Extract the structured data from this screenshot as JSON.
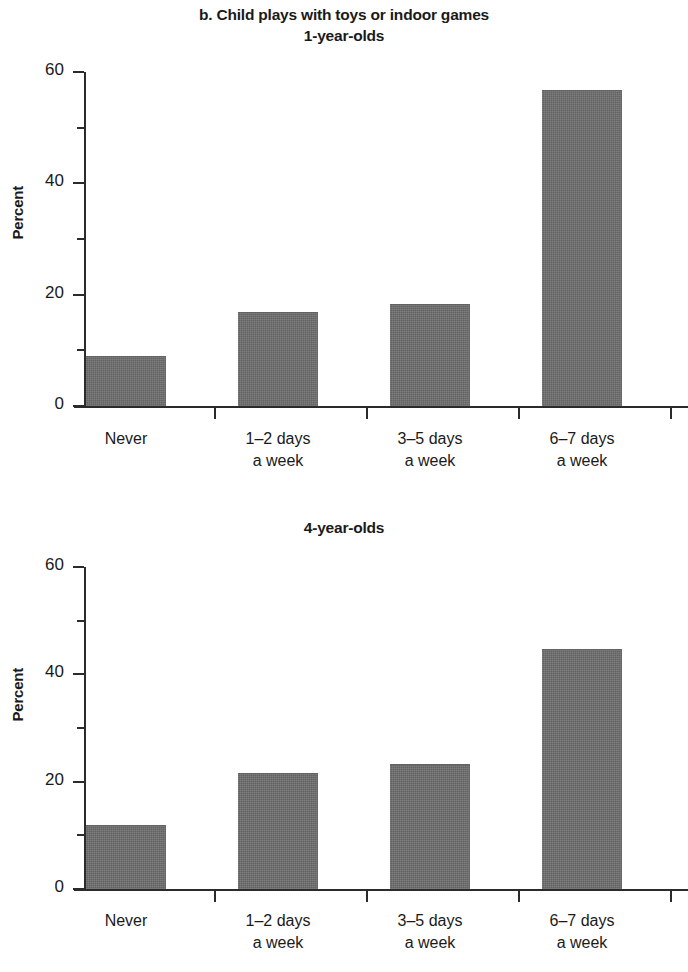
{
  "figure": {
    "title": "b. Child plays with toys or indoor games",
    "subtitle": "1-year-olds",
    "panel2_title": "4-year-olds",
    "bar_color": "#6e6e6e",
    "axis_color": "#2b2b2b"
  },
  "chart_data": [
    {
      "type": "bar",
      "title": "b. Child plays with toys or indoor games",
      "subtitle": "1-year-olds",
      "xlabel": "",
      "ylabel": "Percent",
      "ylim": [
        0,
        60
      ],
      "yticks": [
        0,
        20,
        40,
        60
      ],
      "ytick_labels": [
        "0",
        "20",
        "40",
        "60"
      ],
      "yminor_ticks": [
        10,
        30,
        50
      ],
      "grid": false,
      "legend": "none",
      "categories": [
        "Never",
        "1–2 days\na week",
        "3–5 days\na week",
        "6–7 days\na week"
      ],
      "values": [
        8.8,
        16.7,
        18.2,
        56.5
      ]
    },
    {
      "type": "bar",
      "title": "4-year-olds",
      "xlabel": "",
      "ylabel": "Percent",
      "ylim": [
        0,
        60
      ],
      "yticks": [
        0,
        20,
        40,
        60
      ],
      "ytick_labels": [
        "0",
        "20",
        "40",
        "60"
      ],
      "yminor_ticks": [
        10,
        30,
        50
      ],
      "grid": false,
      "legend": "none",
      "categories": [
        "Never",
        "1–2 days\na week",
        "3–5 days\na week",
        "6–7 days\na week"
      ],
      "values": [
        11.7,
        21.5,
        23.2,
        44.5
      ]
    }
  ]
}
